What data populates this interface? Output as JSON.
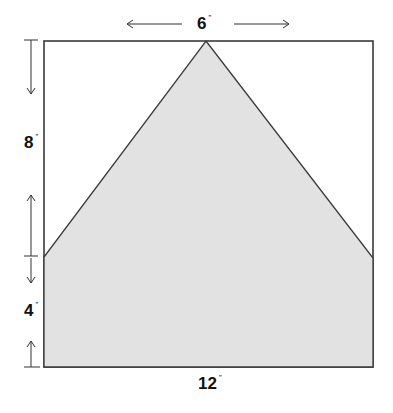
{
  "diagram": {
    "labels": {
      "top_width": "6",
      "top_unit": "”",
      "upper_height": "8",
      "upper_unit": "”",
      "lower_height": "4",
      "lower_unit": "”",
      "bottom_width": "12",
      "bottom_unit": "”"
    },
    "colors": {
      "outline": "#3a3a3a",
      "fill": "#e2e2e2",
      "text": "#111111",
      "background": "#ffffff"
    }
  }
}
